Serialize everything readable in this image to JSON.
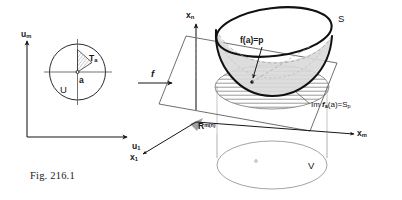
{
  "figure": {
    "caption": "Fig. 216.1",
    "background_color": "#ffffff",
    "ink_color": "#161616"
  },
  "left_panel": {
    "name": "domain-disc",
    "axis_vertical_label_base": "u",
    "axis_vertical_label_sub": "m",
    "axis_horizontal_label_base": "u",
    "axis_horizontal_label_sub": "1",
    "disc_label": "U",
    "sector_label_base": "T",
    "sector_label_sub": "a",
    "point_label": "a",
    "shading_color": "#9a9a9a"
  },
  "map_arrow": {
    "label": "f"
  },
  "right_panel": {
    "name": "target-space",
    "axis_vertical_label_base": "x",
    "axis_vertical_label_sub": "n",
    "axis_right_label_base": "x",
    "axis_right_label_sub": "m",
    "axis_front_label_base": "x",
    "axis_front_label_sub": "1",
    "surface_label": "S",
    "image_point_label": "f(a)=p",
    "tangent_image_label_prefix": "Im ",
    "tangent_image_label_f": "f",
    "tangent_image_label_f_sub": "a",
    "tangent_image_label_arg": "(a)=S",
    "tangent_image_label_arg_sub": "p",
    "space_label_base": "R",
    "space_label_sup": "m(n)",
    "region_label": "V",
    "surface_fill_color": "#d9d9d9",
    "hatch_color": "#6b6b6b",
    "rim_color": "#111111"
  }
}
